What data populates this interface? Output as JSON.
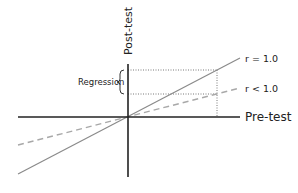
{
  "diagram": {
    "axes": {
      "x_label": "Pre-test",
      "y_label": "Post-test"
    },
    "lines": [
      {
        "id": "r_equal_1",
        "label": "r = 1.0",
        "style": "solid",
        "color": "#8a8a8a"
      },
      {
        "id": "r_less_1",
        "label": "r < 1.0",
        "style": "dashed",
        "color": "#a8a8a8"
      }
    ],
    "annotation": {
      "label": "Regression",
      "symbol": "{"
    },
    "colors": {
      "axis": "#222222",
      "guide": "#555555"
    }
  }
}
